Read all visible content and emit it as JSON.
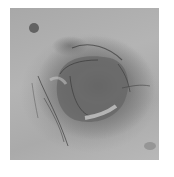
{
  "image": {
    "description": "Grayscale micrograph of a dark oval cell-like structure with fibrous filaments, on a light gray textured background",
    "colors": {
      "background": "#b0b0b0",
      "dark_body": "#5e5e5e",
      "filament": "#3a3a3a",
      "highlight": "#d0d0d0",
      "border": "#ffffff"
    }
  }
}
